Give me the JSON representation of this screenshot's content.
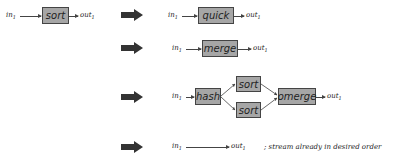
{
  "source": {
    "input": "in",
    "input_sub": "1",
    "operator": "sort",
    "output": "out",
    "output_sub": "1"
  },
  "rewrites": [
    {
      "input": "in",
      "input_sub": "1",
      "operators": [
        "quick"
      ],
      "output": "out",
      "output_sub": "1"
    },
    {
      "input": "in",
      "input_sub": "1",
      "operators": [
        "merge"
      ],
      "output": "out",
      "output_sub": "1"
    },
    {
      "input": "in",
      "input_sub": "1",
      "operators": [
        "hash",
        "sort",
        "sort",
        "omerge"
      ],
      "output": "out",
      "output_sub": "1"
    },
    {
      "input": "in",
      "input_sub": "1",
      "operators": [],
      "output": "out",
      "output_sub": "1",
      "note": "; stream already in desired order"
    }
  ],
  "colors": {
    "box_fill": "#a6a6a6",
    "box_border": "#444444",
    "arrow": "#333333"
  }
}
